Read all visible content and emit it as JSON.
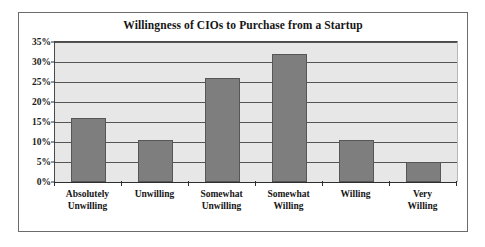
{
  "chart_data": {
    "type": "bar",
    "title": "Willingness of CIOs to Purchase from a Startup",
    "xlabel": "",
    "ylabel": "",
    "categories": [
      "Absolutely\nUnwilling",
      "Unwilling",
      "Somewhat\nUnwilling",
      "Somewhat\nWilling",
      "Willing",
      "Very Willing"
    ],
    "values": [
      16,
      10.5,
      26,
      32,
      10.5,
      5
    ],
    "ylim": [
      0,
      35
    ],
    "ytick_values": [
      0,
      5,
      10,
      15,
      20,
      25,
      30,
      35
    ],
    "ytick_labels": [
      "0%",
      "5%",
      "10%",
      "15%",
      "20%",
      "25%",
      "30%",
      "35%"
    ],
    "grid": true,
    "legend": null,
    "legend_position": "none",
    "colors": {
      "bar_fill": "#7e7e7e",
      "bar_edge": "#565656",
      "plot_background": "#e7e7e7",
      "gridline": "#555555",
      "axis": "#2e2e2e",
      "frame_border": "#6b6b6b",
      "text": "#161616",
      "page_background": "#ffffff"
    }
  }
}
